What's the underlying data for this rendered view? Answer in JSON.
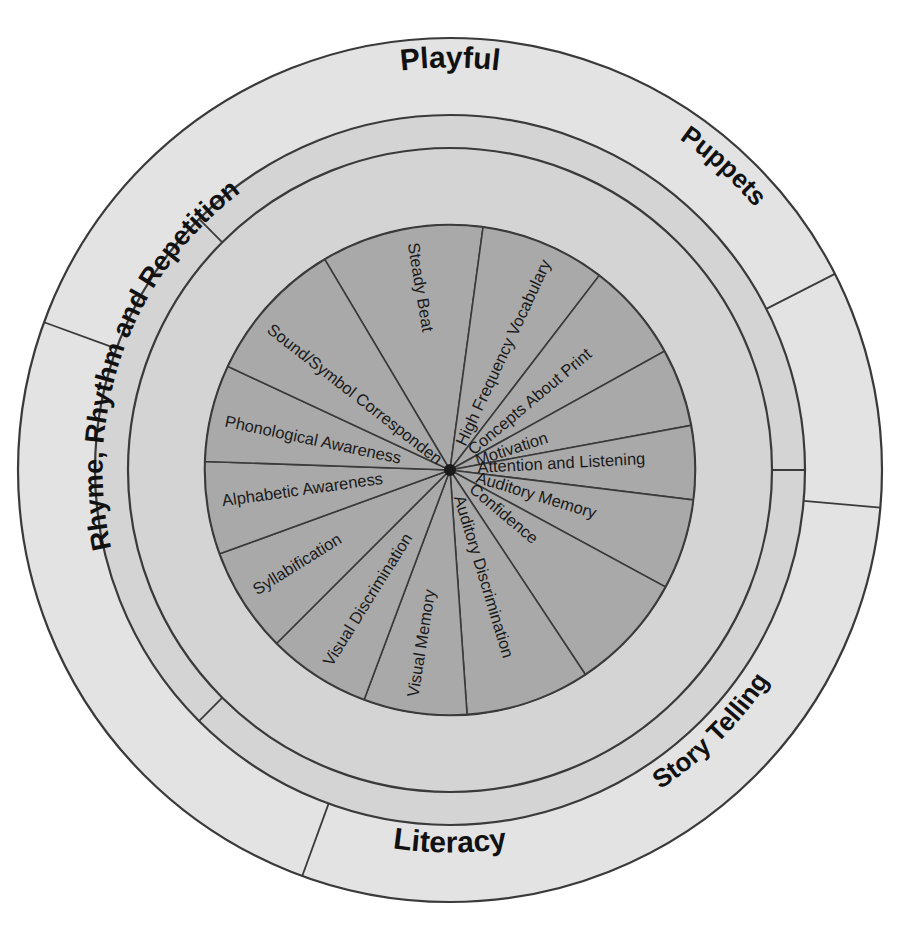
{
  "diagram": {
    "center": {
      "x": 450,
      "y": 470
    },
    "radii": {
      "outer": 432,
      "outer_inner": 355,
      "middle_inner": 322,
      "inner_disc": 245,
      "hub": 6
    },
    "colors": {
      "outer_ring": "#e3e3e3",
      "middle_ring": "#d4d4d4",
      "inner_disc": "#a9a9a9",
      "stroke": "#3a3a3a",
      "text": "#1a1a1a",
      "background": "#ffffff"
    },
    "outer_ring": {
      "name": "outer-ring",
      "segments": [
        {
          "id": "playful",
          "label": "Playful",
          "start_deg": 200,
          "end_deg": 333,
          "text_angle_deg": 270,
          "flip": false,
          "font_size": 30
        },
        {
          "id": "puppets",
          "label": "Puppets",
          "start_deg": 333,
          "end_deg": 5,
          "text_angle_deg": 312,
          "flip": false,
          "font_size": 26
        },
        {
          "id": "storytelling",
          "label": "Story Telling",
          "start_deg": 5,
          "end_deg": 110,
          "text_angle_deg": 45,
          "flip": true,
          "font_size": 26
        },
        {
          "id": "literacy",
          "label": "Literacy",
          "start_deg": 110,
          "end_deg": 200,
          "text_angle_deg": 90,
          "flip": true,
          "font_size": 30
        }
      ]
    },
    "middle_ring": {
      "name": "middle-ring",
      "label": "Rhyme, Rhythm and Repetition",
      "divider_angles_deg": [
        0,
        135,
        225
      ],
      "text_angle_deg": 200,
      "flip": false,
      "font_size": 27
    },
    "inner_wheel": {
      "name": "inner-wheel",
      "segment_count": 14,
      "start_angle_deg": 270,
      "segments": [
        {
          "id": "steady-beat",
          "label": "Steady Beat",
          "angle_deg": 260.5,
          "flip": true
        },
        {
          "id": "high-frequency-vocabulary",
          "label": "High Frequency Vocabulary",
          "angle_deg": 295,
          "flip": false
        },
        {
          "id": "concepts-about-print",
          "label": "Concepts About Print",
          "angle_deg": 320,
          "flip": false
        },
        {
          "id": "motivation",
          "label": "Motivation",
          "angle_deg": 342,
          "flip": false
        },
        {
          "id": "attention-and-listening",
          "label": "Attention and  Listening",
          "angle_deg": 357,
          "flip": false
        },
        {
          "id": "auditory-memory",
          "label": "Auditory Memory",
          "angle_deg": 17,
          "flip": false
        },
        {
          "id": "confidence",
          "label": "Confidence",
          "angle_deg": 40,
          "flip": false
        },
        {
          "id": "auditory-discrimination",
          "label": "Auditory Discrimination",
          "angle_deg": 73,
          "flip": false
        },
        {
          "id": "visual-memory",
          "label": "Visual Memory",
          "angle_deg": 99,
          "flip": false
        },
        {
          "id": "visual-discrimination",
          "label": "Visual Discrimination",
          "angle_deg": 122,
          "flip": false
        },
        {
          "id": "syllabification",
          "label": "Syllabification",
          "angle_deg": 148,
          "flip": false
        },
        {
          "id": "alphabetic-awareness",
          "label": "Alphabetic Awareness",
          "angle_deg": 172,
          "flip": false
        },
        {
          "id": "phonological-awareness",
          "label": "Phonological Awareness",
          "angle_deg": 192,
          "flip": false
        },
        {
          "id": "sound-symbol-correspondence",
          "label": "Sound/Symbol Correspondence",
          "angle_deg": 218,
          "flip": false
        }
      ]
    }
  }
}
